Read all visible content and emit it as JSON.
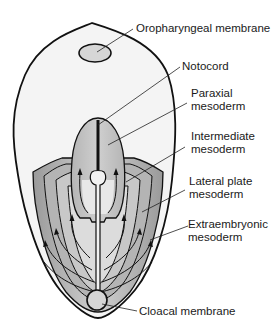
{
  "diagram": {
    "type": "embryonic-disc-mesoderm-schematic",
    "labels": {
      "oropharyngeal_membrane": "Oropharyngeal membrane",
      "notocord": "Notocord",
      "paraxial_l1": "Paraxial",
      "paraxial_l2": "mesoderm",
      "intermediate_l1": "Intermediate",
      "intermediate_l2": "mesoderm",
      "lateral_l1": "Lateral plate",
      "lateral_l2": "mesoderm",
      "extra_l1": "Extraembryonic",
      "extra_l2": "mesoderm",
      "cloacal_membrane": "Cloacal membrane"
    },
    "colors": {
      "outline": "#111111",
      "disc_fill": "#f4f4f4",
      "membrane_fill": "#d6d6d6",
      "paraxial_fill": "#bdbdbd",
      "intermediate_fill": "#a9a9a9",
      "lateral_fill": "#8f8f8f",
      "extra_fill": "#c4c4c4",
      "inner_fill": "#e6e6e6"
    }
  }
}
